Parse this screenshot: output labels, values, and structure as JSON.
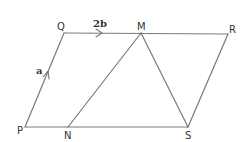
{
  "diagram": {
    "type": "geometry-vectors",
    "line_color": "#7a7a7a",
    "text_color": "#333333",
    "vertices": {
      "P": {
        "label": "P",
        "x": 25,
        "y": 127
      },
      "Q": {
        "label": "Q",
        "x": 64,
        "y": 33
      },
      "M": {
        "label": "M",
        "x": 141,
        "y": 33
      },
      "R": {
        "label": "R",
        "x": 228,
        "y": 34
      },
      "N": {
        "label": "N",
        "x": 68,
        "y": 127
      },
      "S": {
        "label": "S",
        "x": 188,
        "y": 127
      }
    },
    "edges": [
      {
        "from": "P",
        "to": "Q"
      },
      {
        "from": "Q",
        "to": "R"
      },
      {
        "from": "R",
        "to": "S"
      },
      {
        "from": "P",
        "to": "S"
      },
      {
        "from": "N",
        "to": "M"
      },
      {
        "from": "M",
        "to": "S"
      }
    ],
    "vectors": [
      {
        "edge": "PQ",
        "label": "a",
        "direction": "P to Q"
      },
      {
        "edge": "QM",
        "label": "2b",
        "direction": "Q to M"
      }
    ]
  }
}
